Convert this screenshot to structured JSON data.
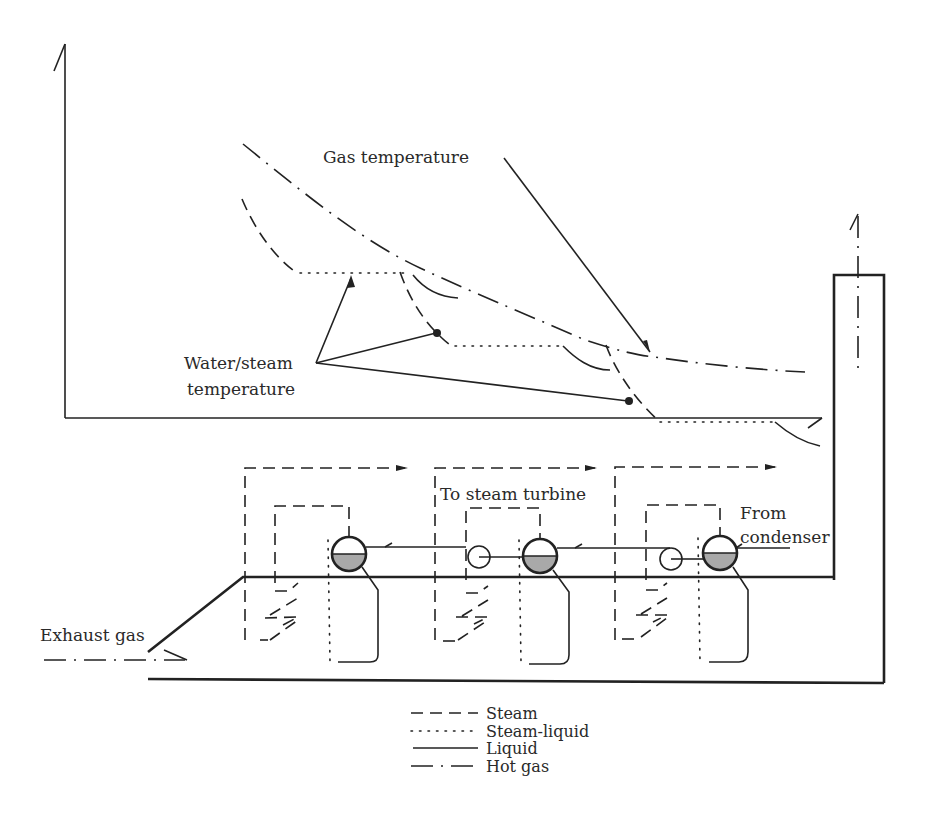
{
  "diagram": {
    "type": "HRSG temperature profile and schematic",
    "labels": {
      "gas_temperature": "Gas temperature",
      "water_steam_line1": "Water/steam",
      "water_steam_line2": "temperature",
      "to_steam_turbine": "To steam turbine",
      "from_condenser_line1": "From",
      "from_condenser_line2": "condenser",
      "exhaust_gas": "Exhaust gas"
    },
    "legend": [
      {
        "style": "dashed",
        "label": "Steam"
      },
      {
        "style": "dotted",
        "label": "Steam-liquid"
      },
      {
        "style": "solid",
        "label": "Liquid"
      },
      {
        "style": "dash-dot",
        "label": "Hot gas"
      }
    ],
    "colors": {
      "line": "#222222",
      "drum_liquid_fill": "#a9a9a9",
      "background": "#ffffff"
    },
    "components": {
      "pressure_stages": 3,
      "drums": 3,
      "pumps": 2,
      "stack": 1
    }
  }
}
